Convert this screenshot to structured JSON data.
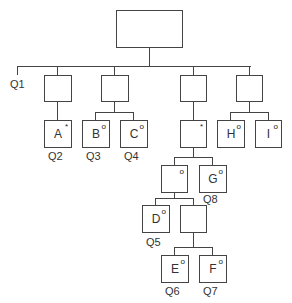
{
  "diagram": {
    "type": "jackson-structure-diagram",
    "nodes": {
      "root": {
        "label": ""
      },
      "l1a": {
        "label": ""
      },
      "l1b": {
        "label": ""
      },
      "l1c": {
        "label": ""
      },
      "l1d": {
        "label": ""
      },
      "A": {
        "label": "A",
        "marker": "*"
      },
      "B": {
        "label": "B",
        "marker": "o"
      },
      "C": {
        "label": "C",
        "marker": "o"
      },
      "iter": {
        "label": "",
        "marker": "*"
      },
      "H": {
        "label": "H",
        "marker": "o"
      },
      "I": {
        "label": "I",
        "marker": "o"
      },
      "sel1": {
        "label": "",
        "marker": "o"
      },
      "G": {
        "label": "G",
        "marker": "o"
      },
      "D": {
        "label": "D",
        "marker": "o"
      },
      "seq2": {
        "label": ""
      },
      "E": {
        "label": "E",
        "marker": "o"
      },
      "F": {
        "label": "F",
        "marker": "o"
      }
    },
    "questions": {
      "q1": "Q1",
      "q2": "Q2",
      "q3": "Q3",
      "q4": "Q4",
      "q5": "Q5",
      "q6": "Q6",
      "q7": "Q7",
      "q8": "Q8"
    }
  }
}
